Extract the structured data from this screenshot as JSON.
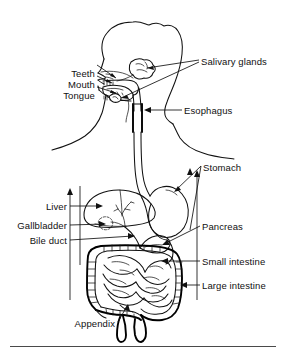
{
  "figure": {
    "background_color": "#ffffff",
    "line_color": "#111111",
    "width": 286,
    "height": 361
  },
  "labels": {
    "teeth": "Teeth",
    "mouth": "Mouth",
    "tongue": "Tongue",
    "salivary_glands": "Salivary glands",
    "esophagus": "Esophagus",
    "stomach": "Stomach",
    "liver": "Liver",
    "gallbladder": "Gallbladder",
    "bile_duct": "Bile duct",
    "pancreas": "Pancreas",
    "small_intestine": "Small intestine",
    "large_intestine": "Large intestine",
    "appendix": "Appendix"
  },
  "label_list": [
    {
      "key": "teeth",
      "text": "Teeth",
      "side": "left",
      "x": 95,
      "y": 68
    },
    {
      "key": "mouth",
      "text": "Mouth",
      "side": "left",
      "x": 95,
      "y": 79
    },
    {
      "key": "tongue",
      "text": "Tongue",
      "side": "left",
      "x": 95,
      "y": 90
    },
    {
      "key": "salivary_glands",
      "text": "Salivary glands",
      "side": "right",
      "x": 201,
      "y": 56
    },
    {
      "key": "esophagus",
      "text": "Esophagus",
      "side": "right",
      "x": 184,
      "y": 106
    },
    {
      "key": "stomach",
      "text": "Stomach",
      "side": "right",
      "x": 203,
      "y": 163
    },
    {
      "key": "liver",
      "text": "Liver",
      "side": "left",
      "x": 67,
      "y": 202
    },
    {
      "key": "gallbladder",
      "text": "Gallbladder",
      "side": "left",
      "x": 67,
      "y": 221
    },
    {
      "key": "bile_duct",
      "text": "Bile duct",
      "side": "left",
      "x": 67,
      "y": 236
    },
    {
      "key": "pancreas",
      "text": "Pancreas",
      "side": "right",
      "x": 202,
      "y": 222
    },
    {
      "key": "small_intestine",
      "text": "Small intestine",
      "side": "right",
      "x": 202,
      "y": 257
    },
    {
      "key": "large_intestine",
      "text": "Large intestine",
      "side": "right",
      "x": 202,
      "y": 281
    },
    {
      "key": "appendix",
      "text": "Appendix",
      "side": "left",
      "x": 115,
      "y": 319
    }
  ],
  "organs": [
    "head-outline",
    "nasal-cavity",
    "hard-palate",
    "soft-palate",
    "tongue",
    "teeth",
    "salivary-gland-parotid",
    "salivary-gland-sublingual",
    "pharynx",
    "esophagus",
    "stomach",
    "liver",
    "gallbladder",
    "bile-duct",
    "pancreas",
    "small-intestine",
    "large-intestine",
    "cecum",
    "appendix",
    "rectum"
  ]
}
